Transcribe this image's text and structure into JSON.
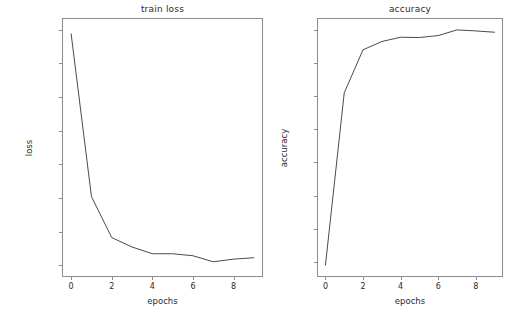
{
  "figure": {
    "width": 524,
    "height": 317,
    "background": "#ffffff",
    "line_color": "#4a4a4a",
    "axis_color": "#8c8c8c",
    "text_color": "#2b2b2b"
  },
  "chart_data": [
    {
      "type": "line",
      "title": "train loss",
      "xlabel": "epochs",
      "ylabel": "loss",
      "x": [
        0,
        1,
        2,
        3,
        4,
        5,
        6,
        7,
        8,
        9
      ],
      "values": [
        0.172,
        0.051,
        0.0205,
        0.0135,
        0.0085,
        0.0085,
        0.007,
        0.0025,
        0.0045,
        0.0055
      ],
      "xlim": [
        -0.45,
        9.45
      ],
      "ylim": [
        -0.0088,
        0.1838
      ],
      "xticks": [
        0,
        2,
        4,
        6,
        8
      ],
      "xticklabels": [
        "0",
        "2",
        "4",
        "6",
        "8"
      ],
      "yticks": [
        0.0,
        0.025,
        0.05,
        0.075,
        0.1,
        0.125,
        0.15,
        0.175
      ],
      "yticklabels": [
        "0.000",
        "0.025",
        "0.050",
        "0.075",
        "0.100",
        "0.125",
        "0.150",
        "0.175"
      ],
      "grid": false,
      "legend": false
    },
    {
      "type": "line",
      "title": "accuracy",
      "xlabel": "epochs",
      "ylabel": "accuracy",
      "x": [
        0,
        1,
        2,
        3,
        4,
        5,
        6,
        7,
        8,
        9
      ],
      "values": [
        0.929,
        0.981,
        0.994,
        0.9965,
        0.9978,
        0.9977,
        0.9983,
        1.0,
        0.9997,
        0.9993
      ],
      "xlim": [
        -0.45,
        9.45
      ],
      "ylim": [
        0.9254,
        1.0036
      ],
      "xticks": [
        0,
        2,
        4,
        6,
        8
      ],
      "xticklabels": [
        "0",
        "2",
        "4",
        "6",
        "8"
      ],
      "yticks": [
        0.93,
        0.94,
        0.95,
        0.96,
        0.97,
        0.98,
        0.99,
        1.0
      ],
      "yticklabels": [
        "0.93",
        "0.94",
        "0.95",
        "0.96",
        "0.97",
        "0.98",
        "0.99",
        "1.00"
      ],
      "grid": false,
      "legend": false
    }
  ],
  "panels": [
    {
      "frame": {
        "left": 62,
        "top": 18,
        "width": 201,
        "height": 259
      }
    },
    {
      "frame": {
        "left": 317,
        "top": 18,
        "width": 186,
        "height": 259
      }
    }
  ]
}
